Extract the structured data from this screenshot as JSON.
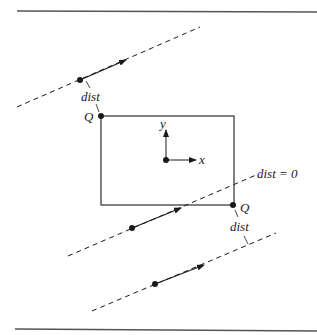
{
  "figure": {
    "labels": {
      "dist_top": "dist",
      "dist_bottom": "dist",
      "dist_zero": "dist = 0",
      "q_top_left": "Q",
      "q_bottom_right": "Q",
      "axis_x": "x",
      "axis_y": "y"
    },
    "colors": {
      "ink": "#1a1a1a",
      "rule": "#555555",
      "background": "#ffffff"
    }
  }
}
